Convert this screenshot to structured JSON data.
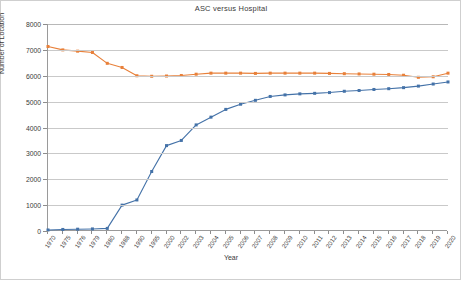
{
  "chart_data": {
    "type": "line",
    "title": "ASC versus Hospital",
    "xlabel": "Year",
    "ylabel": "Number of Location",
    "ylim": [
      0,
      8000
    ],
    "ytick_step": 1000,
    "yticks": [
      "0",
      "1000",
      "2000",
      "3000",
      "4000",
      "5000",
      "6000",
      "7000",
      "8000"
    ],
    "grid": true,
    "legend": "none",
    "categories": [
      "1970",
      "1975",
      "1976",
      "1979",
      "1980",
      "1988",
      "1990",
      "1995",
      "2000",
      "2002",
      "2003",
      "2004",
      "2005",
      "2006",
      "2007",
      "2008",
      "2009",
      "2010",
      "2011",
      "2012",
      "2013",
      "2014",
      "2015",
      "2016",
      "2017",
      "2018",
      "2019",
      "2020"
    ],
    "series": [
      {
        "name": "ASC",
        "color": "#4472a8",
        "values": [
          40,
          60,
          70,
          80,
          100,
          1000,
          1200,
          2300,
          3300,
          3500,
          4100,
          4400,
          4700,
          4900,
          5050,
          5200,
          5260,
          5300,
          5320,
          5350,
          5400,
          5430,
          5470,
          5500,
          5540,
          5600,
          5680,
          5760
        ]
      },
      {
        "name": "Hospital",
        "color": "#e8803a",
        "values": [
          7130,
          7000,
          6950,
          6900,
          6480,
          6320,
          6000,
          5980,
          5990,
          6010,
          6060,
          6100,
          6100,
          6100,
          6090,
          6100,
          6100,
          6100,
          6100,
          6090,
          6080,
          6070,
          6060,
          6050,
          6020,
          5940,
          5960,
          6100
        ]
      }
    ]
  },
  "axes": {
    "x_title": "Year",
    "y_title": "Number of Location"
  }
}
